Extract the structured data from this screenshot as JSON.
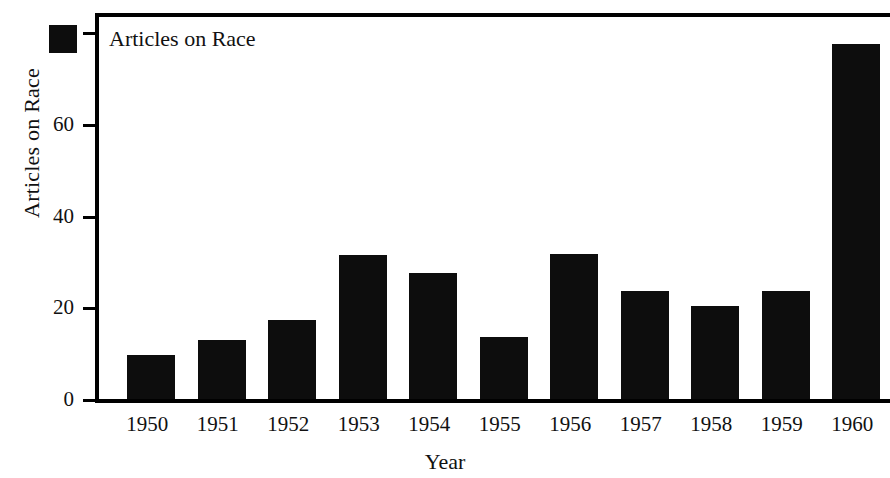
{
  "chart_data": {
    "type": "bar",
    "title": "",
    "subtitle": "",
    "xlabel": "Year",
    "ylabel": "Articles on Race",
    "categories": [
      "1950",
      "1951",
      "1952",
      "1953",
      "1954",
      "1955",
      "1956",
      "1957",
      "1958",
      "1959",
      "1960"
    ],
    "values": [
      9.5,
      12.8,
      17.3,
      31.5,
      27.4,
      13.6,
      31.6,
      23.5,
      20.4,
      23.6,
      77.5
    ],
    "series": [
      {
        "name": "Articles on Race",
        "color": "#0d0d0d",
        "values": [
          9.5,
          12.8,
          17.3,
          31.5,
          27.4,
          13.6,
          31.6,
          23.5,
          20.4,
          23.6,
          77.5
        ]
      }
    ],
    "ylim": [
      0,
      84
    ],
    "yticks": [
      0,
      20,
      40,
      60,
      80
    ],
    "ytick_labels": [
      "0",
      "20",
      "40",
      "60",
      "80"
    ],
    "grid": false,
    "legend": {
      "position": "top-left",
      "entries": [
        {
          "label": "Articles on Race",
          "color": "#0d0d0d"
        }
      ]
    },
    "bar_color": "#0d0d0d",
    "background_color": "#ffffff",
    "axis_color": "#000000"
  }
}
